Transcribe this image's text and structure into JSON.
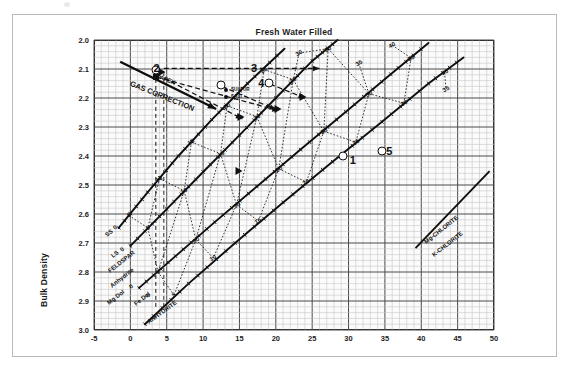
{
  "figure": {
    "title": "Fresh Water Filled",
    "xaxis_title": "CNL Porosity Limestone",
    "yaxis_title": "Bulk Density"
  },
  "legend": {
    "items": [
      {
        "marker": "filled-dot",
        "label": "SULFUR"
      },
      {
        "marker": "filled-dot",
        "label": "SALT"
      }
    ]
  },
  "annotations": {
    "gas_correction": "GAS CORRECTION",
    "apex": "APEX",
    "numbers": [
      {
        "id": "2",
        "x": 3.6,
        "y": 2.095
      },
      {
        "id": "3",
        "x": 17.0,
        "y": 2.095
      },
      {
        "id": "4",
        "x": 18.0,
        "y": 2.148
      },
      {
        "id": "1",
        "x": 30.6,
        "y": 2.415
      },
      {
        "id": "5",
        "x": 35.6,
        "y": 2.382
      }
    ]
  },
  "lithology_labels": [
    {
      "text": "SS",
      "x": -3.6,
      "y": 2.665,
      "rot": -38
    },
    {
      "text": "0",
      "x": -2.5,
      "y": 2.64,
      "rot": -38
    },
    {
      "text": "LS",
      "x": -2.8,
      "y": 2.737,
      "rot": -38
    },
    {
      "text": "0",
      "x": -1.6,
      "y": 2.716,
      "rot": -38
    },
    {
      "text": "FELDSPAR",
      "x": -3.2,
      "y": 2.79,
      "rot": -38
    },
    {
      "text": "Anhydrite",
      "x": -3.0,
      "y": 2.84,
      "rot": -38
    },
    {
      "text": "Mg Dol",
      "x": -3.3,
      "y": 2.9,
      "rot": -38
    },
    {
      "text": "0",
      "x": -0.3,
      "y": 2.846,
      "rot": -38
    },
    {
      "text": "Fe Dol",
      "x": 0.4,
      "y": 2.905,
      "rot": -38
    },
    {
      "text": "0",
      "x": 2.0,
      "y": 2.875,
      "rot": -38
    },
    {
      "text": "ANHYDRITE",
      "x": 2.1,
      "y": 2.965,
      "rot": -36
    },
    {
      "text": "Mg-CHLORITE",
      "x": 40.2,
      "y": 2.69,
      "rot": -38
    },
    {
      "text": "K-CHLORITE",
      "x": 41.4,
      "y": 2.735,
      "rot": -38
    }
  ],
  "chart_data": {
    "type": "scatter",
    "title": "Fresh Water Filled",
    "xlabel": "CNL Porosity Limestone",
    "ylabel": "Bulk Density",
    "xlim": [
      -5,
      50
    ],
    "ylim": [
      3.0,
      2.0
    ],
    "y_inverted": true,
    "xticks": [
      -5,
      0,
      5,
      10,
      15,
      20,
      25,
      30,
      35,
      40,
      45,
      50
    ],
    "yticks": [
      2.0,
      2.1,
      2.2,
      2.3,
      2.4,
      2.5,
      2.6,
      2.7,
      2.8,
      2.9,
      3.0
    ],
    "grid": "major-and-minor",
    "minor_per_major_x": 5,
    "minor_per_major_y": 5,
    "legend_position": "top-left-inside",
    "lithology_lines": [
      {
        "name": "Sandstone",
        "porosity_ticks": [
          0,
          5,
          10,
          15,
          20,
          25,
          30,
          35,
          40
        ],
        "points": [
          [
            -1.6,
            2.648
          ],
          [
            2.4,
            2.525
          ],
          [
            6.6,
            2.4
          ],
          [
            11.2,
            2.275
          ],
          [
            16.1,
            2.15
          ],
          [
            21.2,
            2.03
          ]
        ],
        "label_ticks": [
          {
            "v": 5,
            "x": -0.2,
            "y": 2.605
          },
          {
            "v": 10,
            "x": 4.0,
            "y": 2.478
          },
          {
            "v": 15,
            "x": 8.4,
            "y": 2.352
          },
          {
            "v": 20,
            "x": 13.3,
            "y": 2.227
          },
          {
            "v": 25,
            "x": 18.4,
            "y": 2.102
          },
          {
            "v": 30,
            "x": 23.2,
            "y": 2.045
          }
        ]
      },
      {
        "name": "Limestone",
        "porosity_ticks": [
          0,
          5,
          10,
          15,
          20,
          25,
          30,
          35,
          40
        ],
        "points": [
          [
            0.0,
            2.71
          ],
          [
            5.0,
            2.583
          ],
          [
            10.0,
            2.455
          ],
          [
            15.0,
            2.328
          ],
          [
            20.0,
            2.2
          ],
          [
            25.0,
            2.072
          ],
          [
            28.5,
            2.0
          ]
        ],
        "label_ticks": [
          {
            "v": 5,
            "x": 2.4,
            "y": 2.648
          },
          {
            "v": 10,
            "x": 7.4,
            "y": 2.52
          },
          {
            "v": 15,
            "x": 12.4,
            "y": 2.392
          },
          {
            "v": 20,
            "x": 17.4,
            "y": 2.264
          },
          {
            "v": 25,
            "x": 22.4,
            "y": 2.137
          },
          {
            "v": 30,
            "x": 27.2,
            "y": 2.03
          },
          {
            "v": 35,
            "x": 31.4,
            "y": 2.08
          },
          {
            "v": 40,
            "x": 36.0,
            "y": 2.018
          }
        ]
      },
      {
        "name": "Dolomite",
        "porosity_ticks": [
          0,
          5,
          10,
          15,
          20,
          25,
          30,
          35,
          40
        ],
        "points": [
          [
            1.2,
            2.855
          ],
          [
            6.2,
            2.745
          ],
          [
            11.6,
            2.628
          ],
          [
            17.4,
            2.505
          ],
          [
            23.4,
            2.378
          ],
          [
            29.6,
            2.248
          ],
          [
            35.8,
            2.118
          ],
          [
            41.0,
            2.01
          ]
        ],
        "label_ticks": [
          {
            "v": 5,
            "x": 3.8,
            "y": 2.8
          },
          {
            "v": 10,
            "x": 9.0,
            "y": 2.688
          },
          {
            "v": 15,
            "x": 14.6,
            "y": 2.568
          },
          {
            "v": 20,
            "x": 20.4,
            "y": 2.444
          },
          {
            "v": 25,
            "x": 26.6,
            "y": 2.315
          },
          {
            "v": 30,
            "x": 32.8,
            "y": 2.185
          },
          {
            "v": 35,
            "x": 38.6,
            "y": 2.062
          },
          {
            "v": 40,
            "x": 43.2,
            "y": 2.112
          }
        ]
      },
      {
        "name": "Dolomite-2",
        "porosity_ticks": [
          0,
          10,
          20,
          30,
          40
        ],
        "points": [
          [
            2.0,
            2.98
          ],
          [
            8.0,
            2.84
          ],
          [
            14.4,
            2.7
          ],
          [
            21.0,
            2.56
          ],
          [
            27.8,
            2.42
          ],
          [
            34.6,
            2.282
          ],
          [
            41.0,
            2.15
          ],
          [
            45.8,
            2.06
          ]
        ],
        "label_ticks": [
          {
            "v": 5,
            "x": 6.0,
            "y": 2.88
          },
          {
            "v": 10,
            "x": 11.4,
            "y": 2.752
          },
          {
            "v": 15,
            "x": 17.6,
            "y": 2.624
          },
          {
            "v": 20,
            "x": 24.2,
            "y": 2.49
          },
          {
            "v": 25,
            "x": 31.0,
            "y": 2.352
          },
          {
            "v": 30,
            "x": 37.6,
            "y": 2.218
          },
          {
            "v": 35,
            "x": 43.4,
            "y": 2.17
          }
        ]
      }
    ],
    "chlorite_line": {
      "points": [
        [
          39.2,
          2.718
        ],
        [
          49.4,
          2.452
        ]
      ]
    },
    "gas_correction_arrow": {
      "from": [
        -1.4,
        2.075
      ],
      "to": [
        11.8,
        2.238
      ]
    },
    "data_points": [
      {
        "marker": "open-circle",
        "x": 3.5,
        "y": 2.105,
        "label": "2"
      },
      {
        "marker": "open-circle",
        "x": 12.4,
        "y": 2.155,
        "label": ""
      },
      {
        "marker": "open-circle",
        "x": 19.0,
        "y": 2.148,
        "label": "4"
      },
      {
        "marker": "open-circle",
        "x": 29.2,
        "y": 2.4,
        "label": ""
      },
      {
        "marker": "open-circle",
        "x": 34.6,
        "y": 2.382,
        "label": "5"
      },
      {
        "marker": "filled-square",
        "x": 3.5,
        "y": 2.128,
        "label": ""
      },
      {
        "marker": "filled-triangle",
        "x": 4.4,
        "y": 2.11,
        "label": ""
      },
      {
        "marker": "filled-triangle",
        "x": 15.2,
        "y": 2.265,
        "label": ""
      },
      {
        "marker": "filled-triangle",
        "x": 20.3,
        "y": 2.238,
        "label": ""
      },
      {
        "marker": "filled-triangle",
        "x": 23.8,
        "y": 2.195,
        "label": ""
      },
      {
        "marker": "filled-triangle",
        "x": 15.0,
        "y": 2.452,
        "label": ""
      }
    ]
  }
}
